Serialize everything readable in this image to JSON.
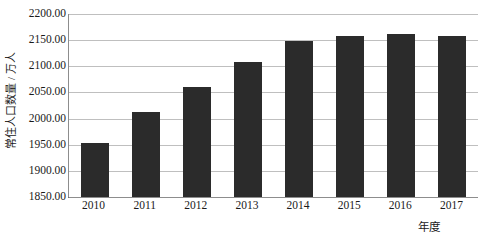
{
  "chart_data": {
    "type": "bar",
    "title": "",
    "subtitle": "",
    "xlabel": "年度",
    "ylabel": "常住人口数量 / 万人",
    "categories": [
      "2010",
      "2011",
      "2012",
      "2013",
      "2014",
      "2015",
      "2016",
      "2017"
    ],
    "values": [
      1954,
      2013,
      2061,
      2108,
      2148,
      2158,
      2162,
      2157
    ],
    "series": [
      {
        "name": "常住人口数量",
        "values": [
          1954,
          2013,
          2061,
          2108,
          2148,
          2158,
          2162,
          2157
        ]
      }
    ],
    "ylim": [
      1850,
      2200
    ],
    "ytick_values": [
      1850,
      1900,
      1950,
      2000,
      2050,
      2100,
      2150,
      2200
    ],
    "ytick_labels": [
      "1850.00",
      "1900.00",
      "1950.00",
      "2000.00",
      "2050.00",
      "2100.00",
      "2150.00",
      "2200.00"
    ],
    "grid": true,
    "legend": false,
    "legend_position": "none",
    "bar_color": "#2b2b2b",
    "grid_color": "#bfbfbf",
    "axis_color": "#8d8d8d"
  }
}
